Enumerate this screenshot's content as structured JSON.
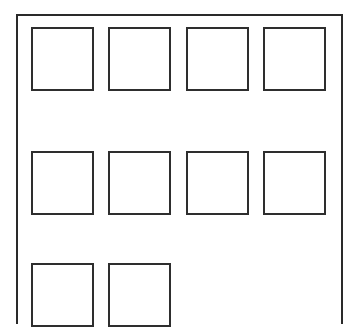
{
  "diagram": {
    "colors": {
      "stroke": "#2e2e2e",
      "background": "#ffffff"
    },
    "grid": {
      "columns": 4,
      "rows": [
        {
          "cells": 4
        },
        {
          "cells": 4
        },
        {
          "cells": 2
        }
      ],
      "total_cells": 10
    }
  }
}
